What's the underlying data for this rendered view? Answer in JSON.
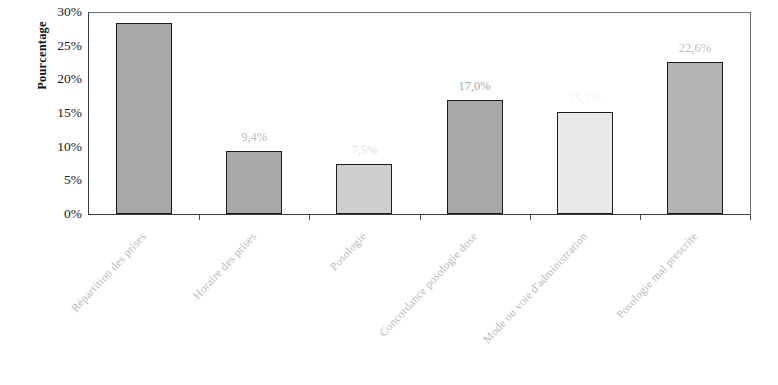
{
  "chart_data": {
    "type": "bar",
    "title": "",
    "subtitle": "",
    "xlabel": "",
    "ylabel": "Pourcentage",
    "ylim": [
      0,
      30
    ],
    "grid": false,
    "legend": "none",
    "y_ticks": [
      "0%",
      "5%",
      "10%",
      "15%",
      "20%",
      "25%",
      "30%"
    ],
    "y_tick_values": [
      0,
      5,
      10,
      15,
      20,
      25,
      30
    ],
    "categories": [
      "Répartition des prises",
      "Horaire des prises",
      "Posologie",
      "Concordance posologie dose",
      "Mode ou voie d'administration",
      "Posologie mal prescrite"
    ],
    "values": [
      28.3,
      9.4,
      7.5,
      17.0,
      15.1,
      22.6
    ],
    "data_labels": [
      "",
      "9,4%",
      "7,5%",
      "17,0%",
      "15,1%",
      "22,6%"
    ],
    "bar_colors": [
      "#a8a8a8",
      "#a8a8a8",
      "#cfcfcf",
      "#a8a8a8",
      "#e8e8e8",
      "#b4b4b4"
    ],
    "bar_label_colors": [
      "#bdbdbd",
      "#bdbdbd",
      "#e2e2e2",
      "#a9a9a9",
      "#f2f2f2",
      "#bdbdbd"
    ],
    "bar_border_color": "#1c1c1c",
    "axis_color": "#3a3a3a",
    "frame_color": "#6e6e6e",
    "category_label_color": "#b9b9b9",
    "background": "#ffffff"
  }
}
